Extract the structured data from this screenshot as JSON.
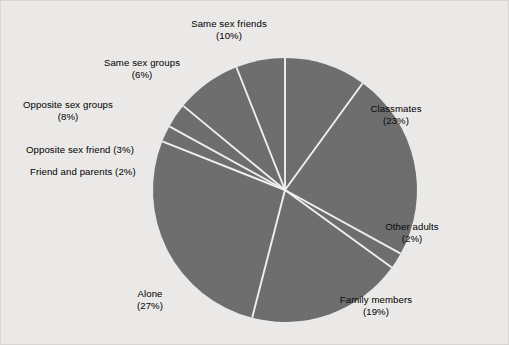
{
  "figure": {
    "background_color": "#ecebe9",
    "border_color": "#d9d8d6",
    "slice_color": "#6e6e6e",
    "separator_color": "#f2f1ef",
    "label_color": "#101010"
  },
  "chart_data": {
    "type": "pie",
    "title": "",
    "subtitle": "",
    "xlabel": "",
    "ylabel": "",
    "grid": false,
    "legend_position": "none",
    "label_format": "name (percent%)",
    "units": "percent",
    "total": 100,
    "start_angle_deg": 0,
    "direction": "clockwise",
    "center_px": {
      "x": 285,
      "y": 190
    },
    "radius_px": 132,
    "categories": [
      "Same sex friends",
      "Classmates",
      "Other adults",
      "Family members",
      "Alone",
      "Friend and parents",
      "Opposite sex friend",
      "Opposite sex groups",
      "Same sex groups"
    ],
    "values": [
      10,
      23,
      2,
      19,
      27,
      2,
      3,
      8,
      6
    ],
    "slices": [
      {
        "name": "Same sex friends",
        "value": 10,
        "percent_label": "(10%)",
        "color": "#6e6e6e",
        "start_deg": 0,
        "end_deg": 36,
        "label_line1": "Same sex friends",
        "label_line2": "(10%)",
        "label_single_line": false,
        "label_align": "center",
        "label_left_px": 229,
        "label_top_px": 18
      },
      {
        "name": "Classmates",
        "value": 23,
        "percent_label": "(23%)",
        "color": "#6e6e6e",
        "start_deg": 36,
        "end_deg": 118.8,
        "label_line1": "Classmates",
        "label_line2": "(23%)",
        "label_single_line": false,
        "label_align": "center",
        "label_left_px": 396,
        "label_top_px": 103
      },
      {
        "name": "Other adults",
        "value": 2,
        "percent_label": "(2%)",
        "color": "#6e6e6e",
        "start_deg": 118.8,
        "end_deg": 126,
        "label_line1": "Other adults",
        "label_line2": "(2%)",
        "label_single_line": false,
        "label_align": "center",
        "label_left_px": 412,
        "label_top_px": 221
      },
      {
        "name": "Family members",
        "value": 19,
        "percent_label": "(19%)",
        "color": "#6e6e6e",
        "start_deg": 126,
        "end_deg": 194.4,
        "label_line1": "Family members",
        "label_line2": "(19%)",
        "label_single_line": false,
        "label_align": "center",
        "label_left_px": 376,
        "label_top_px": 294
      },
      {
        "name": "Alone",
        "value": 27,
        "percent_label": "(27%)",
        "color": "#6e6e6e",
        "start_deg": 194.4,
        "end_deg": 291.6,
        "label_line1": "Alone",
        "label_line2": "(27%)",
        "label_single_line": false,
        "label_align": "center",
        "label_left_px": 150,
        "label_top_px": 288
      },
      {
        "name": "Friend and parents",
        "value": 2,
        "percent_label": "(2%)",
        "color": "#6e6e6e",
        "start_deg": 291.6,
        "end_deg": 298.8,
        "label_line1": "Friend and parents (2%)",
        "label_line2": "",
        "label_single_line": true,
        "label_align": "left",
        "label_left_px": 30,
        "label_top_px": 166
      },
      {
        "name": "Opposite sex friend",
        "value": 3,
        "percent_label": "(3%)",
        "color": "#6e6e6e",
        "start_deg": 298.8,
        "end_deg": 309.6,
        "label_line1": "Opposite sex friend (3%)",
        "label_line2": "",
        "label_single_line": true,
        "label_align": "left",
        "label_left_px": 26,
        "label_top_px": 144
      },
      {
        "name": "Opposite sex groups",
        "value": 8,
        "percent_label": "(8%)",
        "color": "#6e6e6e",
        "start_deg": 309.6,
        "end_deg": 338.4,
        "label_line1": "Opposite sex groups",
        "label_line2": "(8%)",
        "label_single_line": false,
        "label_align": "center",
        "label_left_px": 68,
        "label_top_px": 99
      },
      {
        "name": "Same sex groups",
        "value": 6,
        "percent_label": "(6%)",
        "color": "#6e6e6e",
        "start_deg": 338.4,
        "end_deg": 360,
        "label_line1": "Same sex groups",
        "label_line2": "(6%)",
        "label_single_line": false,
        "label_align": "center",
        "label_left_px": 142,
        "label_top_px": 57
      }
    ]
  }
}
